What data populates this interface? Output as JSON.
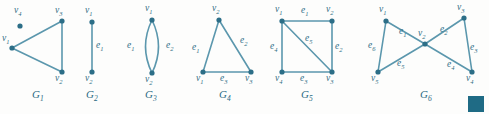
{
  "figure": {
    "background_color": "#fdfdfc",
    "vertex_color": "#2c6e87",
    "edge_color": "#5b97ad",
    "label_color": "#2e6d85",
    "graphs": [
      {
        "id": "G1",
        "caption": "G",
        "caption_sub": "1",
        "caption_pos": {
          "x": 32,
          "y": 88
        },
        "vertices": [
          {
            "name": "v1",
            "label": "v",
            "sub": "1",
            "x": 12,
            "y": 48,
            "label_x": 2,
            "label_y": 33
          },
          {
            "name": "v2",
            "label": "v",
            "sub": "2",
            "x": 62,
            "y": 72,
            "label_x": 55,
            "label_y": 73
          },
          {
            "name": "v3",
            "label": "v",
            "sub": "3",
            "x": 62,
            "y": 21,
            "label_x": 55,
            "label_y": 5
          },
          {
            "name": "v4",
            "label": "v",
            "sub": "4",
            "x": 20,
            "y": 26,
            "label_x": 14,
            "label_y": 5
          }
        ],
        "edges": [
          {
            "name": "v1-v3",
            "from": "v1",
            "to": "v3",
            "label": null
          },
          {
            "name": "v1-v2",
            "from": "v1",
            "to": "v2",
            "label": null
          },
          {
            "name": "v3-v2",
            "from": "v3",
            "to": "v2",
            "label": null
          }
        ]
      },
      {
        "id": "G2",
        "caption": "G",
        "caption_sub": "2",
        "caption_pos": {
          "x": 86,
          "y": 88
        },
        "vertices": [
          {
            "name": "v1",
            "label": "v",
            "sub": "1",
            "x": 92,
            "y": 22,
            "label_x": 85,
            "label_y": 5
          },
          {
            "name": "v2",
            "label": "v",
            "sub": "2",
            "x": 92,
            "y": 72,
            "label_x": 85,
            "label_y": 73
          }
        ],
        "edges": [
          {
            "name": "e1",
            "from": "v1",
            "to": "v2",
            "label": "e",
            "label_sub": "1",
            "label_x": 96,
            "label_y": 40
          }
        ]
      },
      {
        "id": "G3",
        "caption": "G",
        "caption_sub": "3",
        "caption_pos": {
          "x": 145,
          "y": 88
        },
        "vertices": [
          {
            "name": "v1",
            "label": "v",
            "sub": "1",
            "x": 152,
            "y": 20,
            "label_x": 145,
            "label_y": 3
          },
          {
            "name": "v2",
            "label": "v",
            "sub": "2",
            "x": 152,
            "y": 73,
            "label_x": 145,
            "label_y": 74
          }
        ],
        "edges": [
          {
            "name": "e1",
            "from": "v1",
            "to": "v2",
            "curve": "left",
            "label": "e",
            "label_sub": "1",
            "label_x": 127,
            "label_y": 40
          },
          {
            "name": "e2",
            "from": "v1",
            "to": "v2",
            "curve": "right",
            "label": "e",
            "label_sub": "2",
            "label_x": 166,
            "label_y": 40
          }
        ]
      },
      {
        "id": "G4",
        "caption": "G",
        "caption_sub": "4",
        "caption_pos": {
          "x": 219,
          "y": 88
        },
        "vertices": [
          {
            "name": "v1",
            "label": "v",
            "sub": "1",
            "x": 203,
            "y": 72,
            "label_x": 196,
            "label_y": 73
          },
          {
            "name": "v2",
            "label": "v",
            "sub": "2",
            "x": 219,
            "y": 20,
            "label_x": 212,
            "label_y": 3
          },
          {
            "name": "v3",
            "label": "v",
            "sub": "3",
            "x": 251,
            "y": 72,
            "label_x": 245,
            "label_y": 73
          }
        ],
        "edges": [
          {
            "name": "e1",
            "from": "v1",
            "to": "v2",
            "label": "e",
            "label_sub": "1",
            "label_x": 192,
            "label_y": 42
          },
          {
            "name": "e2",
            "from": "v2",
            "to": "v3",
            "label": "e",
            "label_sub": "2",
            "label_x": 240,
            "label_y": 35
          },
          {
            "name": "e3",
            "from": "v1",
            "to": "v3",
            "label": "e",
            "label_sub": "3",
            "label_x": 220,
            "label_y": 73
          }
        ]
      },
      {
        "id": "G5",
        "caption": "G",
        "caption_sub": "5",
        "caption_pos": {
          "x": 301,
          "y": 88
        },
        "vertices": [
          {
            "name": "v1",
            "label": "v",
            "sub": "1",
            "x": 282,
            "y": 21,
            "label_x": 275,
            "label_y": 4
          },
          {
            "name": "v2",
            "label": "v",
            "sub": "2",
            "x": 332,
            "y": 21,
            "label_x": 326,
            "label_y": 4
          },
          {
            "name": "v3",
            "label": "v",
            "sub": "3",
            "x": 332,
            "y": 72,
            "label_x": 326,
            "label_y": 73
          },
          {
            "name": "v4",
            "label": "v",
            "sub": "4",
            "x": 282,
            "y": 72,
            "label_x": 275,
            "label_y": 73
          }
        ],
        "edges": [
          {
            "name": "e1",
            "from": "v1",
            "to": "v2",
            "label": "e",
            "label_sub": "1",
            "label_x": 301,
            "label_y": 5
          },
          {
            "name": "e2",
            "from": "v2",
            "to": "v3",
            "label": "e",
            "label_sub": "2",
            "label_x": 335,
            "label_y": 41
          },
          {
            "name": "e3",
            "from": "v4",
            "to": "v3",
            "label": "e",
            "label_sub": "3",
            "label_x": 300,
            "label_y": 73
          },
          {
            "name": "e4",
            "from": "v1",
            "to": "v4",
            "label": "e",
            "label_sub": "4",
            "label_x": 270,
            "label_y": 41
          },
          {
            "name": "e5",
            "from": "v1",
            "to": "v3",
            "label": "e",
            "label_sub": "5",
            "label_x": 305,
            "label_y": 33
          }
        ]
      },
      {
        "id": "G6",
        "caption": "G",
        "caption_sub": "6",
        "caption_pos": {
          "x": 420,
          "y": 88
        },
        "vertices": [
          {
            "name": "v1",
            "label": "v",
            "sub": "1",
            "x": 386,
            "y": 21,
            "label_x": 379,
            "label_y": 4
          },
          {
            "name": "v2",
            "label": "v",
            "sub": "2",
            "x": 425,
            "y": 44,
            "label_x": 418,
            "label_y": 28
          },
          {
            "name": "v3",
            "label": "v",
            "sub": "3",
            "x": 464,
            "y": 18,
            "label_x": 457,
            "label_y": 2
          },
          {
            "name": "v4",
            "label": "v",
            "sub": "4",
            "x": 472,
            "y": 72,
            "label_x": 466,
            "label_y": 73
          },
          {
            "name": "v5",
            "label": "v",
            "sub": "5",
            "x": 378,
            "y": 72,
            "label_x": 371,
            "label_y": 73
          }
        ],
        "edges": [
          {
            "name": "e1",
            "from": "v1",
            "to": "v2",
            "label": "e",
            "label_sub": "1",
            "label_x": 399,
            "label_y": 26
          },
          {
            "name": "e2",
            "from": "v2",
            "to": "v3",
            "label": "e",
            "label_sub": "2",
            "label_x": 440,
            "label_y": 24
          },
          {
            "name": "e3",
            "from": "v3",
            "to": "v4",
            "label": "e",
            "label_sub": "3",
            "label_x": 470,
            "label_y": 42
          },
          {
            "name": "e4",
            "from": "v2",
            "to": "v4",
            "label": "e",
            "label_sub": "4",
            "label_x": 447,
            "label_y": 59
          },
          {
            "name": "e5",
            "from": "v2",
            "to": "v5",
            "label": "e",
            "label_sub": "5",
            "label_x": 397,
            "label_y": 58
          },
          {
            "name": "e6",
            "from": "v1",
            "to": "v5",
            "label": "e",
            "label_sub": "6",
            "label_x": 368,
            "label_y": 40
          }
        ]
      }
    ],
    "swatch": {
      "name": "color-swatch",
      "color": "#1f6b85",
      "x": 468,
      "y": 96,
      "width": 16,
      "height": 16
    }
  }
}
